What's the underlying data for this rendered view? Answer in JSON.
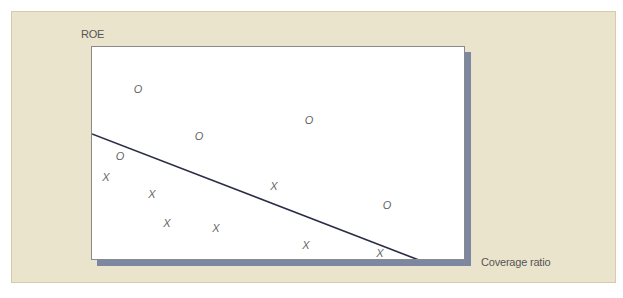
{
  "figure": {
    "y_axis_label": "ROE",
    "x_axis_label": "Coverage ratio",
    "colors": {
      "background_panel": "#ebe4cc",
      "plot_background": "#ffffff",
      "shadow": "#7d879f",
      "line": "#2a2d45",
      "marker": "#666666"
    }
  },
  "chart_data": {
    "type": "scatter",
    "title": "",
    "xlabel": "Coverage ratio",
    "ylabel": "ROE",
    "grid": false,
    "legend": "none",
    "series": [
      {
        "name": "O",
        "marker": "O",
        "points": [
          {
            "x": 138,
            "y": 89
          },
          {
            "x": 199,
            "y": 136
          },
          {
            "x": 309,
            "y": 120
          },
          {
            "x": 120,
            "y": 156
          },
          {
            "x": 387,
            "y": 205
          }
        ]
      },
      {
        "name": "X",
        "marker": "X",
        "points": [
          {
            "x": 106,
            "y": 177
          },
          {
            "x": 152,
            "y": 194
          },
          {
            "x": 274,
            "y": 186
          },
          {
            "x": 167,
            "y": 223
          },
          {
            "x": 216,
            "y": 228
          },
          {
            "x": 306,
            "y": 245
          },
          {
            "x": 380,
            "y": 253
          }
        ]
      }
    ],
    "separating_line": {
      "x1": 91,
      "y1": 133,
      "x2": 423,
      "y2": 261
    }
  }
}
